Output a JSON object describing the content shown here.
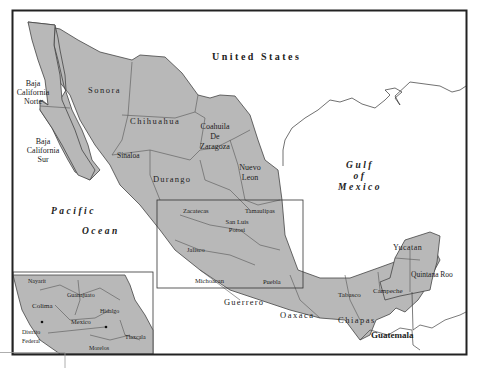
{
  "map": {
    "title_labels": {
      "united_states": "United States",
      "gulf": [
        "Gulf",
        "of",
        "Mexico"
      ],
      "pacific": [
        "Pacific",
        "Ocean"
      ],
      "guatemala": "Guatemala"
    },
    "states": {
      "baja_norte": [
        "Baja",
        "California",
        "Norte"
      ],
      "baja_sur": [
        "Baja",
        "California",
        "Sur"
      ],
      "sonora": "Sonora",
      "chihuahua": "Chihuahua",
      "coahuila": [
        "Coahuila",
        "De",
        "Zaragoza"
      ],
      "sinaloa": "Sinaloa",
      "durango": "Durango",
      "nuevo_leon": [
        "Nuevo",
        "Leon"
      ],
      "zacatecas": "Zacatecas",
      "tamaulipas": "Tamaulipas",
      "san_luis": [
        "San Luis",
        "Potosi"
      ],
      "jalisco": "Jalisco",
      "michoacan": "Michoacan",
      "puebla": "Puebla",
      "guerrero": "Guerrero",
      "oaxaca": "Oaxaca",
      "chiapas": "Chiapas",
      "tabasco": "Tabasco",
      "campeche": "Campeche",
      "yucatan": "Yucatan",
      "quintana_roo": "Quintana Roo"
    },
    "inset": {
      "nayarit": "Nayarit",
      "guanajuato": "Guanajuato",
      "colima": "Colima",
      "hidalgo": "Hidalgo",
      "mexico": "Mexico",
      "distrito_federal": [
        "Distrito",
        "Federal"
      ],
      "tlaxcala": "Tlaxcala",
      "morelos": "Morelos"
    },
    "colors": {
      "land": "#b8b8b8",
      "frame": "#222222"
    }
  }
}
